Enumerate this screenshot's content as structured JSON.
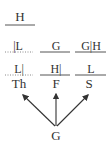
{
  "diagram": {
    "top": {
      "label": "H",
      "line": "solid"
    },
    "row1": [
      {
        "label": "|L",
        "line": "dotted"
      },
      {
        "label": "G",
        "line": "solid"
      },
      {
        "label": "G|H",
        "line": "solid"
      }
    ],
    "row2": [
      {
        "label": "L|",
        "line": "dotted"
      },
      {
        "label": "H|",
        "line": "solid"
      },
      {
        "label": "L",
        "line": "solid"
      }
    ],
    "days": [
      {
        "label": "Th"
      },
      {
        "label": "F"
      },
      {
        "label": "S"
      }
    ],
    "source": {
      "label": "G"
    },
    "arrows": [
      {
        "from": "G",
        "to": "Th"
      },
      {
        "from": "G",
        "to": "F"
      },
      {
        "from": "G",
        "to": "S"
      }
    ]
  }
}
